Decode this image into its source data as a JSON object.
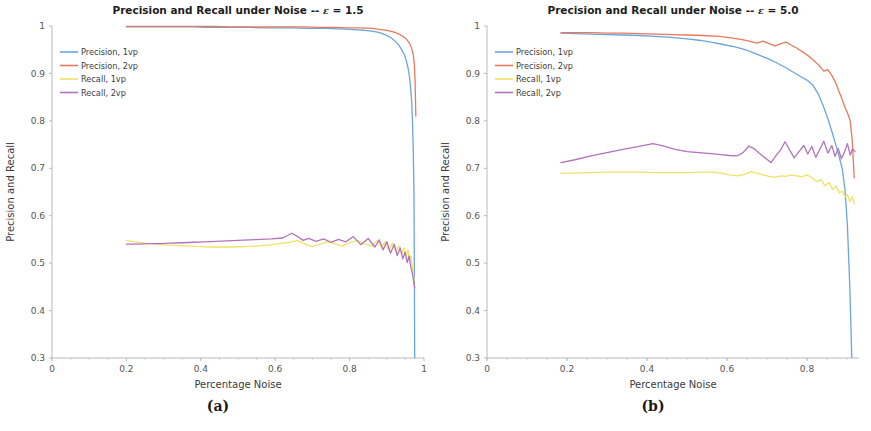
{
  "figure": {
    "background": "#ffffff",
    "panels": [
      {
        "caption": "(a)"
      },
      {
        "caption": "(b)"
      }
    ]
  },
  "colors": {
    "precision_1vp": "#6ba5db",
    "precision_2vp": "#e8795c",
    "recall_1vp": "#f0e265",
    "recall_2vp": "#b273bd",
    "axis": "#b9b9b9",
    "tick_text": "#555555",
    "title_text": "#1d1d1d"
  },
  "chart_data": [
    {
      "type": "line",
      "panel": "a",
      "caption": "(a)",
      "title": "Precision and Recall under Noise -- ε = 1.5",
      "title_prefix": "Precision and Recall under Noise -- ",
      "title_symbol": "ε",
      "title_suffix": " = 1.5",
      "epsilon": 1.5,
      "xlabel": "Percentage Noise",
      "ylabel": "Precision and Recall",
      "xlim": [
        0,
        1.0
      ],
      "ylim": [
        0.3,
        1.0
      ],
      "xticks": [
        0,
        0.2,
        0.4,
        0.6,
        0.8,
        1
      ],
      "xticklabels": [
        "0",
        "0.2",
        "0.4",
        "0.6",
        "0.8",
        "1"
      ],
      "yticks": [
        0.3,
        0.4,
        0.5,
        0.6,
        0.7,
        0.8,
        0.9,
        1
      ],
      "yticklabels": [
        "0.3",
        "0.4",
        "0.5",
        "0.6",
        "0.7",
        "0.8",
        "0.9",
        "1"
      ],
      "grid": false,
      "legend_position": "upper-left",
      "series": [
        {
          "name": "Precision, 1vp",
          "color": "#6ba5db",
          "x": [
            0.2,
            0.23,
            0.26,
            0.29,
            0.32,
            0.35,
            0.38,
            0.41,
            0.44,
            0.47,
            0.5,
            0.53,
            0.56,
            0.59,
            0.62,
            0.65,
            0.68,
            0.71,
            0.74,
            0.77,
            0.8,
            0.82,
            0.84,
            0.86,
            0.875,
            0.885,
            0.895,
            0.905,
            0.915,
            0.925,
            0.932,
            0.94,
            0.947,
            0.952,
            0.957,
            0.961,
            0.964,
            0.967,
            0.969,
            0.971,
            0.973,
            0.974,
            0.975
          ],
          "values": [
            0.998,
            0.998,
            0.998,
            0.998,
            0.998,
            0.998,
            0.998,
            0.997,
            0.997,
            0.997,
            0.997,
            0.997,
            0.996,
            0.996,
            0.996,
            0.996,
            0.995,
            0.995,
            0.995,
            0.994,
            0.993,
            0.992,
            0.991,
            0.989,
            0.987,
            0.985,
            0.982,
            0.978,
            0.973,
            0.966,
            0.96,
            0.95,
            0.94,
            0.928,
            0.912,
            0.893,
            0.87,
            0.84,
            0.8,
            0.74,
            0.65,
            0.5,
            0.3
          ]
        },
        {
          "name": "Precision, 2vp",
          "color": "#e8795c",
          "x": [
            0.2,
            0.24,
            0.28,
            0.32,
            0.36,
            0.4,
            0.44,
            0.48,
            0.52,
            0.56,
            0.6,
            0.64,
            0.68,
            0.72,
            0.76,
            0.8,
            0.83,
            0.86,
            0.88,
            0.9,
            0.915,
            0.93,
            0.942,
            0.952,
            0.96,
            0.966,
            0.971,
            0.974,
            0.976,
            0.978
          ],
          "values": [
            0.999,
            0.999,
            0.999,
            0.999,
            0.999,
            0.999,
            0.999,
            0.998,
            0.998,
            0.998,
            0.998,
            0.998,
            0.998,
            0.997,
            0.997,
            0.996,
            0.996,
            0.995,
            0.993,
            0.991,
            0.988,
            0.984,
            0.979,
            0.973,
            0.965,
            0.955,
            0.94,
            0.92,
            0.885,
            0.81
          ]
        },
        {
          "name": "Recall, 1vp",
          "color": "#f0e265",
          "x": [
            0.2,
            0.22,
            0.25,
            0.28,
            0.31,
            0.34,
            0.37,
            0.4,
            0.43,
            0.46,
            0.49,
            0.52,
            0.55,
            0.58,
            0.61,
            0.64,
            0.66,
            0.68,
            0.7,
            0.72,
            0.74,
            0.76,
            0.78,
            0.8,
            0.82,
            0.84,
            0.86,
            0.875,
            0.885,
            0.895,
            0.905,
            0.915,
            0.925,
            0.932,
            0.94,
            0.947,
            0.952,
            0.957,
            0.961,
            0.965,
            0.968,
            0.971,
            0.974
          ],
          "values": [
            0.548,
            0.545,
            0.542,
            0.54,
            0.538,
            0.537,
            0.536,
            0.535,
            0.534,
            0.534,
            0.534,
            0.535,
            0.536,
            0.538,
            0.541,
            0.544,
            0.548,
            0.54,
            0.535,
            0.54,
            0.545,
            0.541,
            0.536,
            0.543,
            0.548,
            0.541,
            0.536,
            0.548,
            0.534,
            0.545,
            0.527,
            0.542,
            0.524,
            0.536,
            0.52,
            0.532,
            0.516,
            0.528,
            0.508,
            0.515,
            0.496,
            0.48,
            0.463
          ]
        },
        {
          "name": "Recall, 2vp",
          "color": "#b273bd",
          "x": [
            0.2,
            0.23,
            0.26,
            0.29,
            0.32,
            0.35,
            0.38,
            0.41,
            0.44,
            0.47,
            0.5,
            0.53,
            0.56,
            0.59,
            0.62,
            0.645,
            0.66,
            0.675,
            0.69,
            0.71,
            0.73,
            0.75,
            0.77,
            0.79,
            0.81,
            0.83,
            0.85,
            0.868,
            0.88,
            0.89,
            0.9,
            0.91,
            0.92,
            0.928,
            0.936,
            0.943,
            0.949,
            0.955,
            0.96,
            0.965,
            0.969,
            0.972,
            0.975
          ],
          "values": [
            0.54,
            0.54,
            0.541,
            0.541,
            0.542,
            0.543,
            0.544,
            0.545,
            0.546,
            0.547,
            0.548,
            0.549,
            0.55,
            0.551,
            0.553,
            0.563,
            0.556,
            0.548,
            0.552,
            0.546,
            0.551,
            0.544,
            0.55,
            0.545,
            0.556,
            0.539,
            0.552,
            0.534,
            0.549,
            0.528,
            0.545,
            0.521,
            0.54,
            0.516,
            0.532,
            0.509,
            0.523,
            0.501,
            0.515,
            0.49,
            0.478,
            0.462,
            0.448
          ]
        }
      ]
    },
    {
      "type": "line",
      "panel": "b",
      "caption": "(b)",
      "title": "Precision and Recall under Noise -- ε = 5.0",
      "title_prefix": "Precision and Recall under Noise -- ",
      "title_symbol": "ε",
      "title_suffix": " = 5.0",
      "epsilon": 5.0,
      "xlabel": "Percentage Noise",
      "ylabel": "Precision and Recall",
      "xlim": [
        0,
        0.93
      ],
      "ylim": [
        0.3,
        1.0
      ],
      "xticks": [
        0,
        0.2,
        0.4,
        0.6,
        0.8
      ],
      "xticklabels": [
        "0",
        "0.2",
        "0.4",
        "0.6",
        "0.8"
      ],
      "yticks": [
        0.3,
        0.4,
        0.5,
        0.6,
        0.7,
        0.8,
        0.9,
        1
      ],
      "yticklabels": [
        "0.3",
        "0.4",
        "0.5",
        "0.6",
        "0.7",
        "0.8",
        "0.9",
        "1"
      ],
      "grid": false,
      "legend_position": "upper-left",
      "series": [
        {
          "name": "Precision, 1vp",
          "color": "#6ba5db",
          "x": [
            0.185,
            0.22,
            0.26,
            0.3,
            0.34,
            0.38,
            0.42,
            0.46,
            0.5,
            0.53,
            0.56,
            0.59,
            0.62,
            0.645,
            0.665,
            0.685,
            0.705,
            0.725,
            0.745,
            0.765,
            0.785,
            0.8,
            0.815,
            0.828,
            0.84,
            0.852,
            0.862,
            0.872,
            0.88,
            0.888,
            0.895,
            0.901,
            0.907,
            0.912
          ],
          "values": [
            0.985,
            0.984,
            0.983,
            0.982,
            0.981,
            0.98,
            0.978,
            0.976,
            0.973,
            0.97,
            0.966,
            0.961,
            0.956,
            0.95,
            0.944,
            0.937,
            0.93,
            0.922,
            0.913,
            0.903,
            0.893,
            0.886,
            0.875,
            0.857,
            0.833,
            0.805,
            0.778,
            0.75,
            0.726,
            0.7,
            0.655,
            0.58,
            0.45,
            0.3
          ]
        },
        {
          "name": "Precision, 2vp",
          "color": "#e8795c",
          "x": [
            0.185,
            0.22,
            0.26,
            0.3,
            0.34,
            0.38,
            0.42,
            0.46,
            0.5,
            0.54,
            0.58,
            0.61,
            0.635,
            0.655,
            0.675,
            0.69,
            0.705,
            0.72,
            0.735,
            0.748,
            0.76,
            0.775,
            0.79,
            0.805,
            0.818,
            0.83,
            0.842,
            0.852,
            0.862,
            0.872,
            0.88,
            0.888,
            0.895,
            0.902,
            0.908,
            0.913,
            0.918
          ],
          "values": [
            0.986,
            0.986,
            0.986,
            0.985,
            0.985,
            0.984,
            0.983,
            0.982,
            0.981,
            0.98,
            0.978,
            0.975,
            0.972,
            0.968,
            0.964,
            0.968,
            0.963,
            0.958,
            0.963,
            0.966,
            0.96,
            0.953,
            0.945,
            0.936,
            0.926,
            0.917,
            0.905,
            0.908,
            0.896,
            0.88,
            0.862,
            0.845,
            0.828,
            0.815,
            0.8,
            0.76,
            0.68
          ]
        },
        {
          "name": "Recall, 1vp",
          "color": "#f0e265",
          "x": [
            0.185,
            0.22,
            0.26,
            0.3,
            0.34,
            0.38,
            0.42,
            0.46,
            0.5,
            0.53,
            0.56,
            0.585,
            0.605,
            0.625,
            0.645,
            0.66,
            0.675,
            0.69,
            0.705,
            0.72,
            0.735,
            0.748,
            0.76,
            0.775,
            0.788,
            0.8,
            0.812,
            0.824,
            0.835,
            0.845,
            0.855,
            0.864,
            0.873,
            0.881,
            0.888,
            0.895,
            0.901,
            0.907,
            0.913,
            0.918
          ],
          "values": [
            0.69,
            0.69,
            0.691,
            0.692,
            0.692,
            0.692,
            0.691,
            0.691,
            0.691,
            0.692,
            0.692,
            0.69,
            0.686,
            0.684,
            0.687,
            0.693,
            0.69,
            0.686,
            0.683,
            0.681,
            0.684,
            0.683,
            0.686,
            0.684,
            0.682,
            0.686,
            0.68,
            0.672,
            0.676,
            0.663,
            0.67,
            0.655,
            0.662,
            0.648,
            0.652,
            0.64,
            0.645,
            0.63,
            0.64,
            0.625
          ]
        },
        {
          "name": "Recall, 2vp",
          "color": "#b273bd",
          "x": [
            0.185,
            0.22,
            0.26,
            0.3,
            0.34,
            0.38,
            0.415,
            0.44,
            0.47,
            0.5,
            0.53,
            0.56,
            0.585,
            0.605,
            0.625,
            0.64,
            0.655,
            0.668,
            0.68,
            0.695,
            0.71,
            0.722,
            0.735,
            0.745,
            0.757,
            0.768,
            0.78,
            0.792,
            0.802,
            0.812,
            0.822,
            0.832,
            0.842,
            0.852,
            0.862,
            0.87,
            0.878,
            0.886,
            0.894,
            0.901,
            0.908,
            0.914,
            0.92
          ],
          "values": [
            0.712,
            0.718,
            0.726,
            0.733,
            0.74,
            0.746,
            0.752,
            0.747,
            0.74,
            0.735,
            0.733,
            0.731,
            0.729,
            0.727,
            0.726,
            0.733,
            0.747,
            0.741,
            0.732,
            0.722,
            0.712,
            0.726,
            0.74,
            0.756,
            0.738,
            0.722,
            0.735,
            0.748,
            0.73,
            0.746,
            0.723,
            0.74,
            0.757,
            0.732,
            0.748,
            0.725,
            0.742,
            0.72,
            0.735,
            0.752,
            0.728,
            0.741,
            0.735
          ]
        }
      ]
    }
  ]
}
